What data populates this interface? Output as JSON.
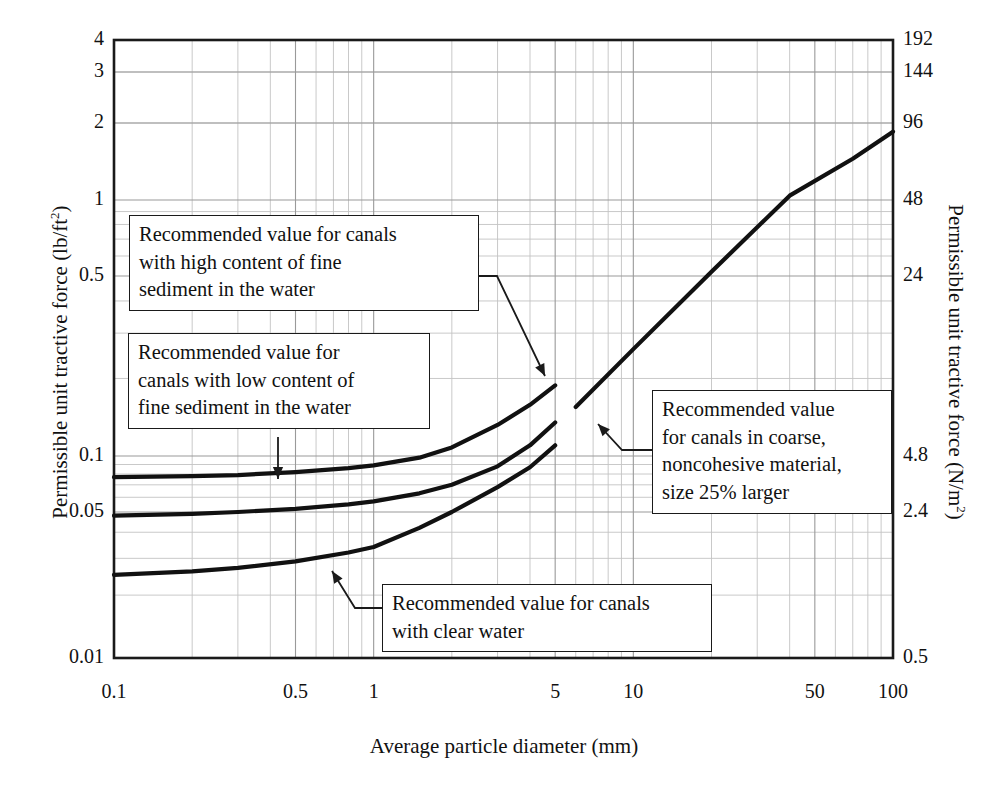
{
  "chart_data": {
    "type": "line",
    "title": "",
    "xlabel": "Average particle diameter (mm)",
    "ylabel": "Permissible unit tractive force (lb/ft2)",
    "ylabel_right": "Permissible unit tractive force (N/m2)",
    "xscale": "log",
    "yscale": "log",
    "xlim": [
      0.1,
      100
    ],
    "ylim": [
      0.01,
      4
    ],
    "grid": true,
    "legend_position": "none",
    "xticks": [
      {
        "value": 0.1,
        "label": "0.1"
      },
      {
        "value": 0.5,
        "label": "0.5"
      },
      {
        "value": 1,
        "label": "1"
      },
      {
        "value": 5,
        "label": "5"
      },
      {
        "value": 10,
        "label": "10"
      },
      {
        "value": 50,
        "label": "50"
      },
      {
        "value": 100,
        "label": "100"
      }
    ],
    "yticks_left": [
      {
        "value": 4,
        "label": "4"
      },
      {
        "value": 3,
        "label": "3"
      },
      {
        "value": 2,
        "label": "2"
      },
      {
        "value": 1,
        "label": "1"
      },
      {
        "value": 0.5,
        "label": "0.5"
      },
      {
        "value": 0.1,
        "label": "0.1"
      },
      {
        "value": 0.05,
        "label": "0.05"
      },
      {
        "value": 0.01,
        "label": "0.01"
      }
    ],
    "yticks_right": [
      {
        "value": 4,
        "label": "192"
      },
      {
        "value": 3,
        "label": "144"
      },
      {
        "value": 2,
        "label": "96"
      },
      {
        "value": 1,
        "label": "48"
      },
      {
        "value": 0.5,
        "label": "24"
      },
      {
        "value": 0.1,
        "label": "4.8"
      },
      {
        "value": 0.05,
        "label": "2.4"
      },
      {
        "value": 0.01,
        "label": "0.5"
      }
    ],
    "series": [
      {
        "name": "Recommended value for canals with high content of fine sediment in the water",
        "x": [
          0.1,
          0.2,
          0.3,
          0.5,
          0.8,
          1.0,
          1.5,
          2.0,
          3.0,
          4.0,
          5.0
        ],
        "y": [
          0.077,
          0.078,
          0.079,
          0.082,
          0.086,
          0.089,
          0.098,
          0.108,
          0.132,
          0.158,
          0.188
        ]
      },
      {
        "name": "Recommended value for canals with low content of fine sediment in the water",
        "x": [
          0.1,
          0.2,
          0.3,
          0.5,
          0.8,
          1.0,
          1.5,
          2.0,
          3.0,
          4.0,
          5.0
        ],
        "y": [
          0.048,
          0.049,
          0.05,
          0.052,
          0.055,
          0.057,
          0.063,
          0.07,
          0.088,
          0.11,
          0.135
        ]
      },
      {
        "name": "Recommended value for canals with clear water",
        "x": [
          0.1,
          0.2,
          0.3,
          0.5,
          0.8,
          1.0,
          1.5,
          2.0,
          3.0,
          4.0,
          5.0
        ],
        "y": [
          0.025,
          0.026,
          0.027,
          0.029,
          0.032,
          0.034,
          0.042,
          0.05,
          0.068,
          0.087,
          0.11
        ]
      },
      {
        "name": "Recommended value for canals in coarse, noncohesive material, size 25% larger",
        "x": [
          6.0,
          10.0,
          20.0,
          40.0,
          70.0,
          100.0
        ],
        "y": [
          0.155,
          0.26,
          0.52,
          1.04,
          1.45,
          1.85
        ]
      }
    ]
  },
  "callouts": [
    {
      "id": "high-sediment",
      "lines": [
        "Recommended value for canals",
        "with high content of fine",
        "sediment in the water"
      ]
    },
    {
      "id": "low-sediment",
      "lines": [
        "Recommended value for",
        "canals with low content of",
        "fine sediment in the water"
      ]
    },
    {
      "id": "coarse-material",
      "lines": [
        "Recommended value",
        "for canals in coarse,",
        "noncohesive material,",
        "size 25% larger"
      ]
    },
    {
      "id": "clear-water",
      "lines": [
        "Recommended value for canals",
        "with clear water"
      ]
    }
  ],
  "axis_titles": {
    "left": "Permissible unit tractive force (lb/ft",
    "left_sup": "2",
    "left_tail": ")",
    "right": "Permissible unit tractive force (N/m",
    "right_sup": "2",
    "right_tail": ")",
    "bottom": "Average particle diameter (mm)"
  },
  "colors": {
    "curve": "#111111",
    "grid_major": "#9a9a9a",
    "grid_minor": "#c3c3c3",
    "frame": "#1a1a1a",
    "background": "#ffffff"
  }
}
